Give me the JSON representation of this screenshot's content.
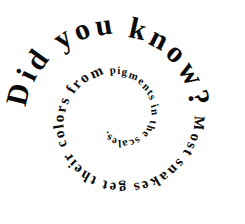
{
  "image": {
    "kind": "spiral-text-graphic",
    "background_color": "#ffffff",
    "text_color": "#0b0b0b",
    "width": 245,
    "height": 224
  },
  "content": {
    "full_text": "Did you know? Most snakes get their colors from pigments in the scales.",
    "headline": "Did you know?",
    "fact": "Most snakes get their colors from pigments in the scales."
  },
  "spiral": {
    "direction": "clockwise-inward",
    "center_x": 118,
    "center_y": 118,
    "start_angle_deg": -175,
    "turns": 1.85,
    "start_radius": 104,
    "end_radius": 20,
    "start_font_size": 30,
    "end_font_size": 9,
    "segments": [
      {
        "text": "Did you know?",
        "font_size": 30,
        "letter_spacing": 1.2
      },
      {
        "text": "Most snakes get their colors from ",
        "font_size": 15,
        "letter_spacing": 0.4
      },
      {
        "text": "pigments in the scales.",
        "font_size": 11,
        "letter_spacing": 0.2
      }
    ]
  },
  "render": {
    "glyph_sequence": "Did you know? Most snakes get their colors from pigments in the scales."
  }
}
